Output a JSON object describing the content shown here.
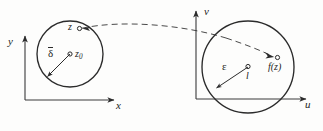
{
  "figure": {
    "kind": "epsilon-delta limit diagram (complex plane mapping)",
    "background": "#fdfdfc",
    "ink": "#2b2b2b",
    "width": 323,
    "height": 131
  },
  "left_plane": {
    "name": "z-plane",
    "axes": {
      "vertical_label": "y",
      "horizontal_label": "x",
      "origin": [
        25,
        100
      ],
      "v_tip": [
        25,
        33
      ],
      "h_tip": [
        118,
        100
      ]
    },
    "disk": {
      "center": [
        70,
        54
      ],
      "radius": 33,
      "center_point_label": "z",
      "center_point_sub": "0",
      "radius_label": "δ̄",
      "radius_label_glyph": "δ",
      "radius_has_overbar": true
    },
    "boundary_point": {
      "label": "z",
      "marker": "small-open-circle",
      "position": [
        78,
        28
      ]
    }
  },
  "right_plane": {
    "name": "w-plane",
    "axes": {
      "vertical_label": "v",
      "horizontal_label": "u",
      "origin": [
        196,
        99
      ],
      "v_tip": [
        196,
        8
      ],
      "h_tip": [
        310,
        99
      ]
    },
    "disk": {
      "center": [
        248,
        67
      ],
      "radius": 46,
      "center_point_label": "l",
      "radius_label": "ε"
    },
    "image_point": {
      "label": "f(z)",
      "marker": "small-open-circle",
      "position": [
        277,
        58
      ]
    }
  },
  "mapping_arrow": {
    "style": "dashed",
    "from": "z (left disk)",
    "to": "f(z) (right disk)",
    "arrowheads": [
      "at z",
      "at f(z)"
    ]
  }
}
